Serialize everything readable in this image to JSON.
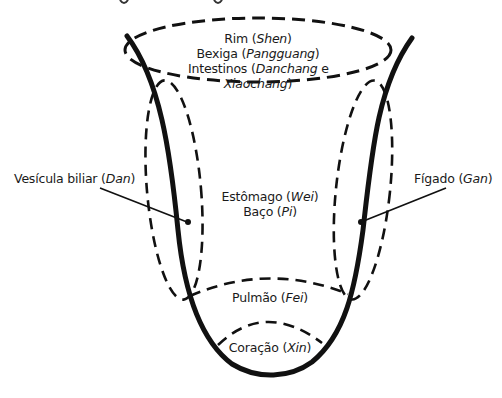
{
  "diagram": {
    "type": "vessel-diagram",
    "colors": {
      "stroke": "#111111",
      "background": "#ffffff",
      "text": "#1a1a1a"
    },
    "labels": {
      "top_region": {
        "line1": {
          "text": "Rim",
          "term": "Shen"
        },
        "line2": {
          "text": "Bexiga",
          "term": "Pangguang"
        },
        "line3": {
          "text": "Intestinos",
          "term": "Danchang",
          "conj": "e"
        },
        "line4": {
          "term": "Xiaochang"
        }
      },
      "left_region": {
        "text": "Vesícula biliar",
        "term": "Dan"
      },
      "right_region": {
        "text": "Fígado",
        "term": "Gan"
      },
      "center_region": {
        "line1": {
          "text": "Estômago",
          "term": "Wei"
        },
        "line2": {
          "text": "Baço",
          "term": "Pi"
        }
      },
      "lower_region": {
        "text": "Pulmão",
        "term": "Fei"
      },
      "bottom_region": {
        "text": "Coração",
        "term": "Xin"
      }
    }
  }
}
